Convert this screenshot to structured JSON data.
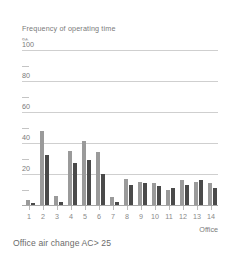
{
  "chart_data": {
    "type": "bar",
    "title": "Frequency of operating time",
    "subtitle": "",
    "xlabel": "Office",
    "ylabel": "%",
    "ylim": [
      0,
      100
    ],
    "yticks": [
      0,
      20,
      40,
      60,
      80,
      100
    ],
    "ytick_labels": [
      "",
      "20",
      "40",
      "60",
      "80",
      "100"
    ],
    "minor_yticks": [
      10,
      30,
      50,
      70,
      90
    ],
    "grid": true,
    "legend": null,
    "categories": [
      "1",
      "2",
      "3",
      "4",
      "5",
      "6",
      "7",
      "8",
      "9",
      "10",
      "11",
      "12",
      "13",
      "14"
    ],
    "series": [
      {
        "name": "light",
        "color": "#9a9a9a",
        "values": [
          3,
          48,
          6,
          35,
          41,
          34,
          5,
          17,
          15,
          14,
          10,
          16,
          15,
          14
        ]
      },
      {
        "name": "dark",
        "color": "#4a4a4a",
        "values": [
          1,
          32,
          2,
          27,
          29,
          20,
          2,
          13,
          14,
          12,
          11,
          13,
          16,
          11
        ]
      }
    ],
    "caption": "Office air change AC> 25"
  },
  "colors": {
    "light_bar": "#9a9a9a",
    "dark_bar": "#4a4a4a",
    "gridline": "#cfcfcf",
    "axis": "#a8a8a8",
    "text": "#7a7a7a",
    "caption_text": "#6b6b6b",
    "background": "#ffffff"
  }
}
